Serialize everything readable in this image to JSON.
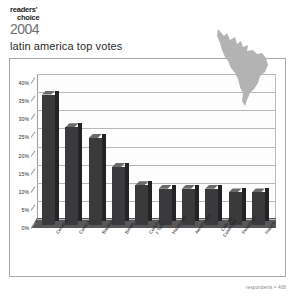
{
  "logo": {
    "line1": "readers'",
    "line2": "choice",
    "year": "2004"
  },
  "title": "latin america top votes",
  "footnote": "respondents = 408",
  "map": {
    "name": "latin-america-map",
    "color": "#b3b3b3"
  },
  "colors": {
    "bar_face": "#3a3a3c",
    "bar_top": "#6a6a6c",
    "bar_side": "#232325",
    "grid": "#b8b8b8",
    "frame": "#a9a9a9",
    "floor": "#58585a"
  },
  "chart_data": {
    "type": "bar",
    "title": "latin america top votes",
    "xlabel": "",
    "ylabel": "",
    "ylim": [
      0,
      40
    ],
    "ytick_labels": [
      "0%",
      "5%",
      "10%",
      "15%",
      "20%",
      "25%",
      "30%",
      "35%",
      "40%"
    ],
    "ytick_values": [
      0,
      5,
      10,
      15,
      20,
      25,
      30,
      35,
      40
    ],
    "grid": true,
    "legend": "none",
    "categories": [
      "Cerveza",
      "Corona",
      "Bacardi",
      "Bimbo",
      "Concha\ny Toro",
      "Havaianas",
      "Aeromexico",
      "Cafe de\nColombia",
      "Petrobras",
      "Natura"
    ],
    "values": [
      36,
      27,
      24,
      16,
      11,
      10,
      10,
      10,
      9,
      9
    ]
  }
}
